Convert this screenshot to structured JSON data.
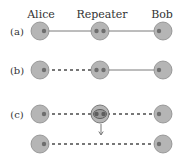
{
  "figure": {
    "column_labels": {
      "alice": "Alice",
      "repeater": "Repeater",
      "bob": "Bob"
    },
    "rows": [
      {
        "label": "(a)",
        "left_link": "solid",
        "right_link": "solid"
      },
      {
        "label": "(b)",
        "left_link": "dashed",
        "right_link": "solid"
      },
      {
        "label": "(c)",
        "left_link": "dashed",
        "right_link": "dashed",
        "repeater_state": "bell-measurement"
      },
      {
        "label": "",
        "end_to_end_link": "dashed"
      }
    ],
    "colors": {
      "node_fill": "#b5b5b5",
      "node_stroke": "#8a8a8a",
      "qubit_fill": "#6e6e6e",
      "link_solid": "#7a7a7a",
      "link_dashed": "#777777",
      "text": "#333333"
    }
  }
}
